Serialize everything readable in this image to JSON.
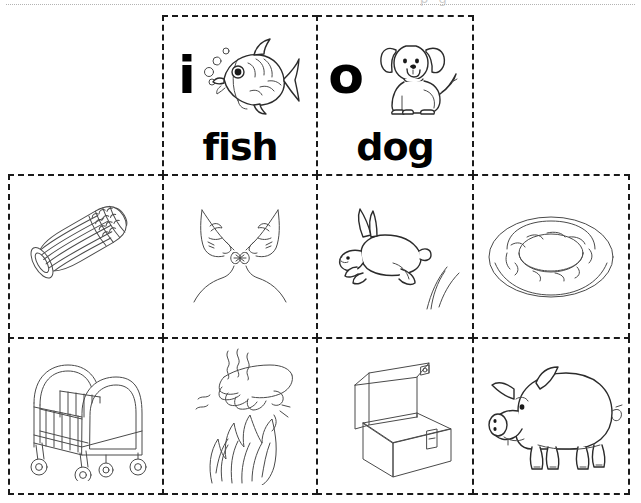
{
  "page": {
    "background_color": "#ffffff",
    "ink_color": "#1a1a1a",
    "border_style": "dashed",
    "top_rule_style": "dotted",
    "top_artifact_text": "p   g"
  },
  "grid": {
    "columns": 4,
    "rows": 3,
    "col_edges_px": [
      8,
      162,
      316,
      472,
      630
    ],
    "row_edges_px": [
      15,
      174,
      337,
      495
    ],
    "row1_span": "columns 2-3 only"
  },
  "rows": [
    {
      "row_name": "letter-cards",
      "cells": [
        {
          "id": "card-i-fish",
          "letter": "i",
          "word": "fish",
          "picture": "fish-icon",
          "picture_label": "fish"
        },
        {
          "id": "card-o-dog",
          "letter": "o",
          "word": "dog",
          "picture": "dog-icon",
          "picture_label": "dog"
        }
      ]
    },
    {
      "row_name": "picture-cards-row-1",
      "cells": [
        {
          "id": "pic-corn",
          "picture": "corn-icon",
          "picture_label": "corn"
        },
        {
          "id": "pic-kiss",
          "picture": "kiss-icon",
          "picture_label": "kiss"
        },
        {
          "id": "pic-rabbit",
          "picture": "rabbit-icon",
          "picture_label": "rabbit"
        },
        {
          "id": "pic-ring",
          "picture": "ring-icon",
          "picture_label": "ring"
        }
      ]
    },
    {
      "row_name": "picture-cards-row-2",
      "cells": [
        {
          "id": "pic-crib",
          "picture": "crib-icon",
          "picture_label": "crib"
        },
        {
          "id": "pic-hot",
          "picture": "hot-icon",
          "picture_label": "hot"
        },
        {
          "id": "pic-box",
          "picture": "box-icon",
          "picture_label": "box"
        },
        {
          "id": "pic-pig",
          "picture": "pig-icon",
          "picture_label": "pig"
        }
      ]
    }
  ]
}
